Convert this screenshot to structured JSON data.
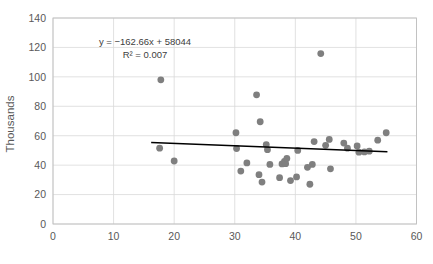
{
  "chart_data": {
    "type": "scatter",
    "title": "",
    "xlabel": "",
    "ylabel": "Thousands",
    "xlim": [
      0,
      60
    ],
    "ylim": [
      0,
      140
    ],
    "xticks": [
      0,
      10,
      20,
      30,
      40,
      50,
      60
    ],
    "yticks": [
      0,
      20,
      40,
      60,
      80,
      100,
      120,
      140
    ],
    "grid": true,
    "legend": "none",
    "marker_color": "#7f7f7f",
    "trendline_color": "#000000",
    "annotations": {
      "equation": "y = −162.66x + 58044",
      "r_squared": "R² = 0.007"
    },
    "trendline": {
      "slope_per_thousand": -0.16266,
      "intercept_thousands": 58.044,
      "x_start": 16.2,
      "x_end": 55.2,
      "y_start": 55.4,
      "y_end": 49.1
    },
    "points": [
      {
        "x": 17.8,
        "y": 98.0
      },
      {
        "x": 17.6,
        "y": 51.5
      },
      {
        "x": 20.0,
        "y": 42.8
      },
      {
        "x": 30.2,
        "y": 62.0
      },
      {
        "x": 30.3,
        "y": 51.3
      },
      {
        "x": 31.0,
        "y": 36.0
      },
      {
        "x": 32.0,
        "y": 41.5
      },
      {
        "x": 33.6,
        "y": 87.8
      },
      {
        "x": 34.2,
        "y": 69.5
      },
      {
        "x": 34.0,
        "y": 33.5
      },
      {
        "x": 34.5,
        "y": 28.5
      },
      {
        "x": 35.2,
        "y": 54.0
      },
      {
        "x": 35.4,
        "y": 50.5
      },
      {
        "x": 35.8,
        "y": 40.5
      },
      {
        "x": 37.4,
        "y": 31.5
      },
      {
        "x": 37.8,
        "y": 40.8
      },
      {
        "x": 38.2,
        "y": 42.5
      },
      {
        "x": 38.4,
        "y": 41.0
      },
      {
        "x": 38.6,
        "y": 44.5
      },
      {
        "x": 39.2,
        "y": 29.5
      },
      {
        "x": 40.4,
        "y": 50.0
      },
      {
        "x": 40.2,
        "y": 32.0
      },
      {
        "x": 42.4,
        "y": 27.0
      },
      {
        "x": 42.0,
        "y": 38.5
      },
      {
        "x": 42.8,
        "y": 40.5
      },
      {
        "x": 43.1,
        "y": 56.0
      },
      {
        "x": 44.2,
        "y": 115.8
      },
      {
        "x": 45.0,
        "y": 53.5
      },
      {
        "x": 45.6,
        "y": 57.5
      },
      {
        "x": 45.8,
        "y": 37.5
      },
      {
        "x": 48.0,
        "y": 55.0
      },
      {
        "x": 48.6,
        "y": 51.5
      },
      {
        "x": 50.2,
        "y": 53.0
      },
      {
        "x": 50.5,
        "y": 48.8
      },
      {
        "x": 51.4,
        "y": 49.0
      },
      {
        "x": 52.2,
        "y": 49.5
      },
      {
        "x": 53.6,
        "y": 57.0
      },
      {
        "x": 55.0,
        "y": 62.0
      }
    ]
  }
}
